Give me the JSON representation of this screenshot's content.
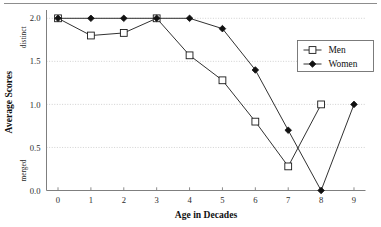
{
  "figure": {
    "has_top_rule": true,
    "background": "#ffffff"
  },
  "chart_data": {
    "type": "line",
    "title": "",
    "xlabel": "Age in Decades",
    "ylabel": "Average Scores",
    "x": [
      0,
      1,
      2,
      3,
      4,
      5,
      6,
      7,
      8,
      9
    ],
    "xticklabels": [
      "0",
      "1",
      "2",
      "3",
      "4",
      "5",
      "6",
      "7",
      "8",
      "9"
    ],
    "yticklabels": [
      "0.0",
      "0.5",
      "1.0",
      "1.5",
      "2.0"
    ],
    "yticks": [
      0.0,
      0.5,
      1.0,
      1.5,
      2.0
    ],
    "xlim": [
      -0.35,
      9.35
    ],
    "ylim": [
      0.0,
      2.05
    ],
    "grid": "horizontal-dotted",
    "legend_position": "upper-right-inside",
    "y_axis_endpoint_labels": {
      "top": "distinct",
      "bottom": "merged"
    },
    "series": [
      {
        "name": "Men",
        "marker": "open-square",
        "color": "#1a1a1a",
        "x": [
          0,
          1,
          2,
          3,
          4,
          5,
          6,
          7,
          8
        ],
        "values": [
          2.0,
          1.8,
          1.83,
          2.0,
          1.57,
          1.28,
          0.8,
          0.28,
          1.0
        ]
      },
      {
        "name": "Women",
        "marker": "filled-diamond",
        "color": "#111111",
        "x": [
          0,
          1,
          2,
          3,
          4,
          5,
          6,
          7,
          8,
          9
        ],
        "values": [
          2.0,
          2.0,
          2.0,
          2.0,
          2.0,
          1.88,
          1.4,
          0.7,
          0.0,
          1.0
        ]
      }
    ],
    "legend": [
      {
        "label": "Men",
        "marker": "open-square"
      },
      {
        "label": "Women",
        "marker": "filled-diamond"
      }
    ]
  }
}
